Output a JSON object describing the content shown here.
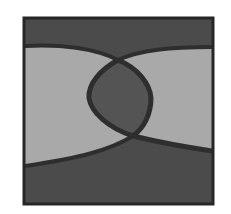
{
  "figure": {
    "colors": {
      "background": "#ffffff",
      "frame": "#262626",
      "dark_region": "#4b4b4b",
      "light_region": "#a9a9a9",
      "curve_band": "#2e2e2e",
      "lens_fill": "#545454"
    },
    "frame_box": {
      "x": 23,
      "y": 17,
      "width": 191,
      "height": 188
    },
    "crossings": [
      {
        "x": 118,
        "y": 60
      },
      {
        "x": 133,
        "y": 136
      }
    ]
  }
}
